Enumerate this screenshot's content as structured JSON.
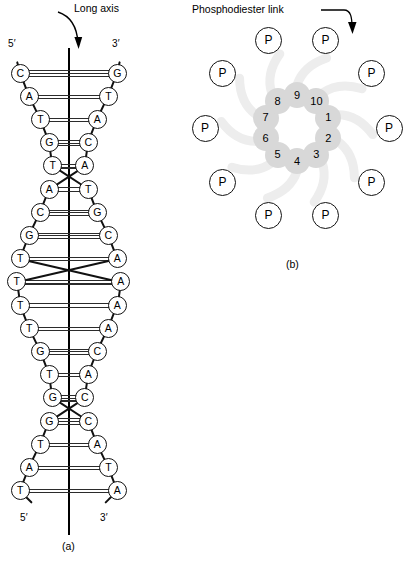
{
  "figure": {
    "panel_a": {
      "caption": "(a)",
      "axis_label": "Long axis",
      "top_left_end": "5′",
      "top_right_end": "3′",
      "bottom_left_end": "5′",
      "bottom_right_end": "3′",
      "base_pairs": [
        {
          "left": "C",
          "right": "G",
          "bonds": 3
        },
        {
          "left": "A",
          "right": "T",
          "bonds": 2
        },
        {
          "left": "T",
          "right": "A",
          "bonds": 2
        },
        {
          "left": "G",
          "right": "C",
          "bonds": 3
        },
        {
          "left": "T",
          "right": "A",
          "bonds": 2
        },
        {
          "left": "T",
          "right": "A",
          "bonds": 2
        },
        {
          "left": "G",
          "right": "C",
          "bonds": 3
        },
        {
          "left": "C",
          "right": "G",
          "bonds": 3
        },
        {
          "left": "A",
          "right": "T",
          "bonds": 2
        },
        {
          "left": "T",
          "right": "A",
          "bonds": 2
        },
        {
          "left": "T",
          "right": "A",
          "bonds": 2
        },
        {
          "left": "T",
          "right": "A",
          "bonds": 2
        },
        {
          "left": "G",
          "right": "C",
          "bonds": 3
        },
        {
          "left": "T",
          "right": "A",
          "bonds": 2
        },
        {
          "left": "G",
          "right": "C",
          "bonds": 3
        },
        {
          "left": "C",
          "right": "G",
          "bonds": 3
        },
        {
          "left": "A",
          "right": "T",
          "bonds": 2
        },
        {
          "left": "T",
          "right": "A",
          "bonds": 2
        },
        {
          "left": "A",
          "right": "T",
          "bonds": 2
        }
      ]
    },
    "panel_b": {
      "caption": "(b)",
      "link_label": "Phosphodiester link",
      "phosphate_label": "P",
      "phosphate_count": 10,
      "sugar_numbers": [
        "1",
        "2",
        "3",
        "4",
        "5",
        "6",
        "7",
        "8",
        "9",
        "10"
      ]
    }
  },
  "colors": {
    "ink": "#000000",
    "rung": "#2b2b2b",
    "sugar_fill": "#d8d8d8",
    "background": "#ffffff"
  }
}
